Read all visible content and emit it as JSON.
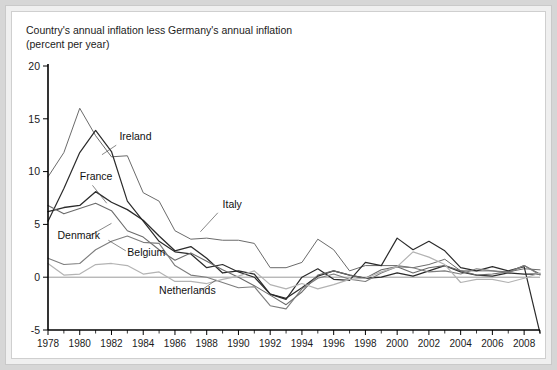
{
  "figure": {
    "title_line1": "Country's annual inflation less Germany's annual inflation",
    "title_line2": "(percent per year)",
    "background": "#d6d6d6",
    "panel_background": "#ffffff"
  },
  "chart_data": {
    "type": "line",
    "title": "Country's annual inflation less Germany's annual inflation (percent per year)",
    "xlabel": "",
    "ylabel": "",
    "xlim": [
      1978,
      2009
    ],
    "ylim": [
      -5,
      20
    ],
    "yticks": [
      -5,
      0,
      5,
      10,
      15,
      20
    ],
    "ytick_labels": [
      "-5",
      "0",
      "5",
      "10",
      "15",
      "20"
    ],
    "xticks": [
      1978,
      1980,
      1982,
      1984,
      1986,
      1988,
      1990,
      1992,
      1994,
      1996,
      1998,
      2000,
      2002,
      2004,
      2006,
      2008
    ],
    "xtick_labels": [
      "1978",
      "1980",
      "1982",
      "1984",
      "1986",
      "1988",
      "1990",
      "1992",
      "1994",
      "1996",
      "1998",
      "2000",
      "2002",
      "2004",
      "2006",
      "2008"
    ],
    "minor_xticks": [
      1979,
      1981,
      1983,
      1985,
      1987,
      1989,
      1991,
      1993,
      1995,
      1997,
      1999,
      2001,
      2003,
      2005,
      2007,
      2009
    ],
    "grid": false,
    "zero_line": true,
    "legend": "inline-labels",
    "x": [
      1978,
      1979,
      1980,
      1981,
      1982,
      1983,
      1984,
      1985,
      1986,
      1987,
      1988,
      1989,
      1990,
      1991,
      1992,
      1993,
      1994,
      1995,
      1996,
      1997,
      1998,
      1999,
      2000,
      2001,
      2002,
      2003,
      2004,
      2005,
      2006,
      2007,
      2008,
      2009
    ],
    "series": [
      {
        "name": "Italy",
        "color": "#6b6b6b",
        "width": 1.0,
        "values": [
          9.5,
          11.8,
          16.0,
          13.4,
          11.4,
          11.5,
          8.0,
          7.2,
          4.4,
          3.6,
          3.7,
          3.5,
          3.5,
          3.2,
          0.9,
          0.9,
          1.4,
          3.6,
          2.6,
          0.6,
          1.1,
          1.1,
          1.1,
          0.9,
          1.2,
          1.7,
          0.6,
          0.6,
          0.6,
          0.5,
          0.8,
          0.7
        ]
      },
      {
        "name": "Ireland",
        "color": "#2b2b2b",
        "width": 1.2,
        "values": [
          5.3,
          8.4,
          11.8,
          13.9,
          11.9,
          7.2,
          5.3,
          3.4,
          2.4,
          2.2,
          0.9,
          1.2,
          0.5,
          0.0,
          -1.6,
          -2.1,
          0.0,
          0.8,
          -0.2,
          -0.3,
          1.4,
          1.1,
          3.7,
          2.6,
          3.4,
          2.5,
          0.9,
          0.6,
          1.0,
          0.6,
          1.0,
          -5.3
        ]
      },
      {
        "name": "France",
        "color": "#2b2b2b",
        "width": 1.3,
        "values": [
          6.2,
          6.6,
          6.8,
          8.1,
          7.1,
          6.4,
          5.4,
          3.9,
          2.5,
          2.9,
          1.8,
          0.4,
          0.6,
          0.3,
          -1.6,
          -2.0,
          -1.0,
          0.1,
          0.6,
          0.2,
          -0.1,
          0.0,
          0.4,
          0.1,
          0.6,
          1.1,
          0.5,
          0.2,
          0.1,
          0.4,
          0.3,
          0.3
        ]
      },
      {
        "name": "Denmark",
        "color": "#6b6b6b",
        "width": 1.1,
        "values": [
          6.8,
          6.0,
          6.5,
          7.0,
          6.3,
          4.4,
          3.8,
          2.6,
          1.6,
          2.3,
          1.5,
          0.7,
          0.0,
          -0.8,
          -1.7,
          -2.6,
          -1.4,
          0.2,
          0.6,
          0.2,
          -0.1,
          0.7,
          1.0,
          0.4,
          0.9,
          1.1,
          0.6,
          0.2,
          0.3,
          0.5,
          1.1,
          0.3
        ]
      },
      {
        "name": "Belgium",
        "color": "#7d7d7d",
        "width": 1.1,
        "values": [
          1.8,
          1.2,
          1.3,
          2.6,
          3.4,
          3.9,
          3.3,
          3.2,
          1.1,
          0.2,
          0.0,
          -0.5,
          -1.0,
          -0.9,
          -2.7,
          -3.0,
          -1.1,
          -0.1,
          0.3,
          -0.2,
          -0.4,
          0.4,
          1.0,
          0.9,
          0.5,
          0.6,
          0.3,
          0.8,
          0.6,
          0.4,
          1.1,
          0.2
        ]
      },
      {
        "name": "Netherlands",
        "color": "#b3b3b3",
        "width": 1.2,
        "values": [
          1.3,
          0.2,
          0.3,
          1.2,
          1.3,
          1.1,
          0.3,
          0.5,
          -0.4,
          -0.4,
          -0.6,
          -0.2,
          0.1,
          0.6,
          -0.7,
          -1.1,
          -0.6,
          -1.1,
          -0.7,
          -0.2,
          -0.1,
          0.5,
          1.0,
          2.4,
          1.9,
          1.2,
          -0.5,
          -0.2,
          -0.2,
          -0.5,
          -0.1,
          0.4
        ]
      }
    ],
    "annotations": [
      {
        "text": "Ireland",
        "x": 1982.5,
        "y": 13.0
      },
      {
        "text": "France",
        "x": 1980.0,
        "y": 9.2
      },
      {
        "text": "Italy",
        "x": 1989.0,
        "y": 6.6
      },
      {
        "text": "Denmark",
        "x": 1978.6,
        "y": 3.6
      },
      {
        "text": "Belgium",
        "x": 1983.0,
        "y": 2.0
      },
      {
        "text": "Netherlands",
        "x": 1985.0,
        "y": -1.6
      }
    ]
  }
}
